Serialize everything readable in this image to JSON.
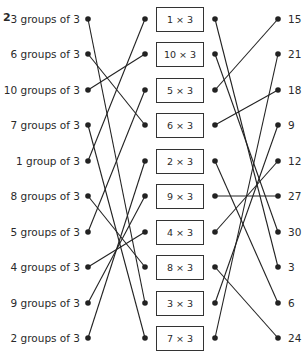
{
  "question_number": "2",
  "left_column": [
    {
      "label": "3 groups of 3"
    },
    {
      "label": "6 groups of 3"
    },
    {
      "label": "10 groups of 3"
    },
    {
      "label": "7 groups of 3"
    },
    {
      "label": "1 group of 3"
    },
    {
      "label": "8 groups of 3"
    },
    {
      "label": "5 groups of 3"
    },
    {
      "label": "4 groups of 3"
    },
    {
      "label": "9 groups of 3"
    },
    {
      "label": "2 groups of 3"
    }
  ],
  "middle_column": [
    {
      "label": "1 × 3"
    },
    {
      "label": "10 × 3"
    },
    {
      "label": "5 × 3"
    },
    {
      "label": "6 × 3"
    },
    {
      "label": "2 × 3"
    },
    {
      "label": "9 × 3"
    },
    {
      "label": "4 × 3"
    },
    {
      "label": "8 × 3"
    },
    {
      "label": "3 × 3"
    },
    {
      "label": "7 × 3"
    }
  ],
  "right_column": [
    {
      "label": "15"
    },
    {
      "label": "21"
    },
    {
      "label": "18"
    },
    {
      "label": "9"
    },
    {
      "label": "12"
    },
    {
      "label": "27"
    },
    {
      "label": "30"
    },
    {
      "label": "3"
    },
    {
      "label": "6"
    },
    {
      "label": "24"
    }
  ],
  "connections_left_to_middle": [
    [
      0,
      8
    ],
    [
      1,
      3
    ],
    [
      2,
      1
    ],
    [
      3,
      9
    ],
    [
      4,
      0
    ],
    [
      5,
      7
    ],
    [
      6,
      2
    ],
    [
      7,
      6
    ],
    [
      8,
      5
    ],
    [
      9,
      4
    ]
  ],
  "connections_middle_to_right": [
    [
      0,
      7
    ],
    [
      1,
      6
    ],
    [
      2,
      0
    ],
    [
      3,
      2
    ],
    [
      4,
      8
    ],
    [
      5,
      5
    ],
    [
      6,
      4
    ],
    [
      7,
      9
    ],
    [
      8,
      3
    ],
    [
      9,
      1
    ]
  ]
}
